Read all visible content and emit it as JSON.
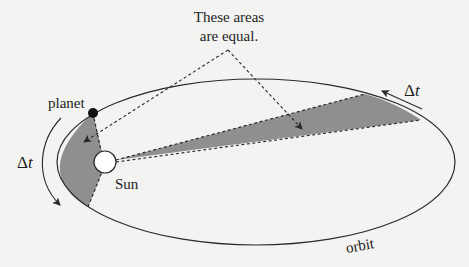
{
  "diagram": {
    "callout": {
      "line1": "These areas",
      "line2": "are equal."
    },
    "labels": {
      "planet": "planet",
      "sun": "Sun",
      "orbit": "orbit",
      "delta_left_symbol": "Δ",
      "delta_left_var": "t",
      "delta_right_symbol": "Δ",
      "delta_right_var": "t"
    },
    "colors": {
      "background": "#f3f3f1",
      "stroke": "#2a2a2a",
      "shaded_area": "#8f8f8f",
      "planet_fill": "#111111",
      "sun_fill": "#ffffff"
    },
    "elements": [
      {
        "id": "orbit-ellipse",
        "type": "ellipse"
      },
      {
        "id": "sun",
        "type": "circle"
      },
      {
        "id": "planet",
        "type": "dot"
      },
      {
        "id": "near-sector",
        "type": "shaded-area"
      },
      {
        "id": "far-sector",
        "type": "shaded-area"
      },
      {
        "id": "callout-arrows",
        "type": "dashed-arrows",
        "count": 2
      },
      {
        "id": "motion-arrows",
        "type": "arrows",
        "count": 2
      }
    ]
  }
}
